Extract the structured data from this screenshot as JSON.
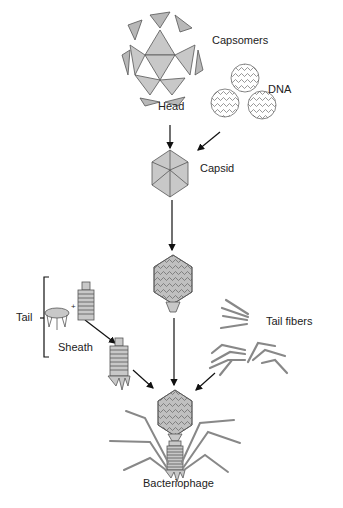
{
  "labels": {
    "capsomers": "Capsomers",
    "head": "Head",
    "dna": "DNA",
    "capsid": "Capsid",
    "tail": "Tail",
    "sheath": "Sheath",
    "tail_fibers": "Tail fibers",
    "bacteriophage": "Bacteriophage",
    "plus": "+"
  },
  "colors": {
    "fill": "#c8c8c8",
    "fill_dark": "#a8a8a8",
    "stroke": "#444444",
    "arrow": "#111111"
  }
}
